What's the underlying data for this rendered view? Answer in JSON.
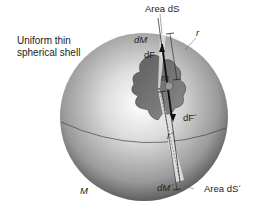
{
  "figure": {
    "caption_lines": [
      "Uniform thin",
      "spherical shell"
    ],
    "labels": {
      "area_top": "Area dS",
      "area_bottom": "Area dS´",
      "mass_top": "dM",
      "mass_bottom": "dM´",
      "force_top": "dF",
      "force_bottom": "dF´",
      "radius_top": "r",
      "radius_bottom": "r´",
      "point_mass": "m",
      "shell_mass": "M"
    },
    "colors": {
      "shell_light": "#f2f2f2",
      "shell_dark": "#4a4a4a",
      "cutaway": "#6e6e6e",
      "strip": "#e8e8e8",
      "line": "#1a1a1a"
    }
  }
}
